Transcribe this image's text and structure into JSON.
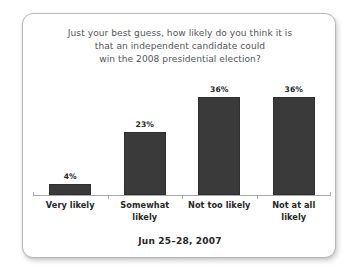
{
  "card": {
    "title_lines": [
      "Just your best guess, how likely do you think it is",
      "that an independent candidate could",
      "win the 2008 presidential election?"
    ],
    "footer": "Jun 25–28, 2007"
  },
  "chart_data": {
    "type": "bar",
    "title": "Just your best guess, how likely do you think it is that an independent candidate could win the 2008 presidential election?",
    "categories": [
      "Very likely",
      "Somewhat likely",
      "Not too likely",
      "Not at all likely"
    ],
    "category_lines": [
      [
        "Very likely"
      ],
      [
        "Somewhat",
        "likely"
      ],
      [
        "Not too likely"
      ],
      [
        "Not at all",
        "likely"
      ]
    ],
    "values": [
      4,
      23,
      36,
      36
    ],
    "value_labels": [
      "4%",
      "23%",
      "36%",
      "36%"
    ],
    "xlabel": "",
    "ylabel": "",
    "ylim": [
      0,
      44
    ],
    "grid": false,
    "legend": false,
    "bar_color": "#3a3a3a",
    "axis_color": "#a9a9a9",
    "label_color": "#272727",
    "title_color": "#54565a"
  }
}
